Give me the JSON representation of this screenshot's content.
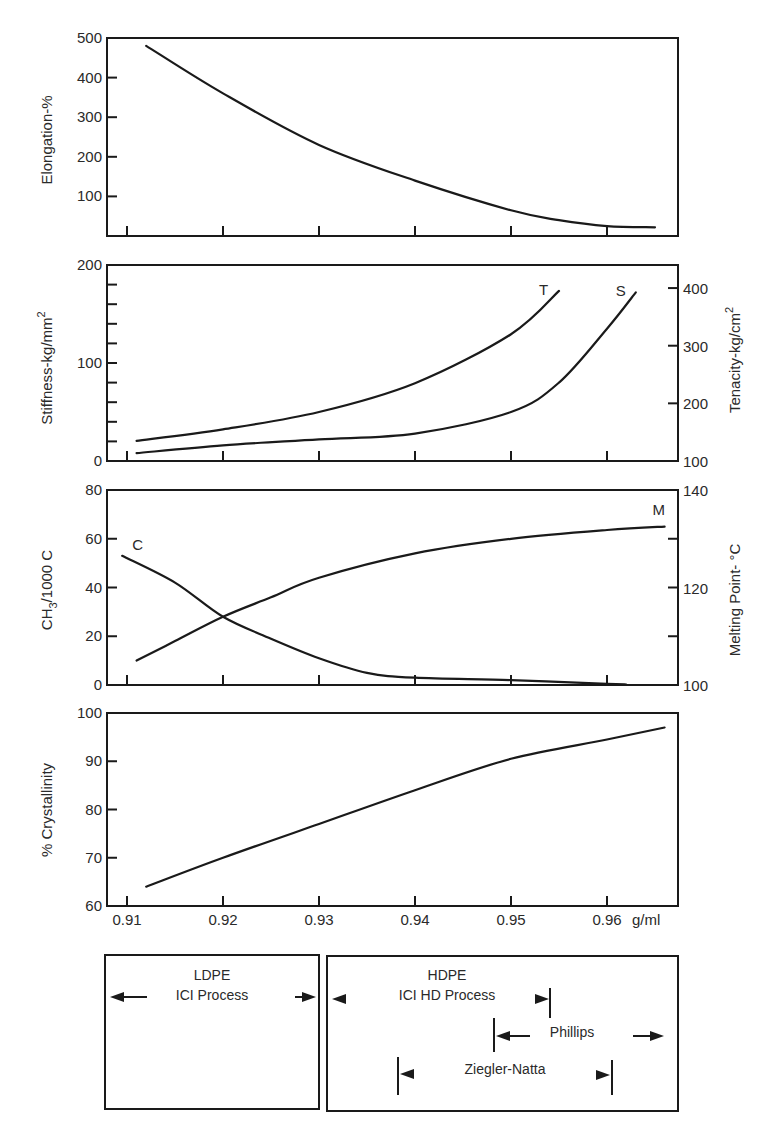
{
  "figure": {
    "x_axis": {
      "unit_label": "g/ml",
      "ticks": [
        "0.91",
        "0.92",
        "0.93",
        "0.94",
        "0.95",
        "0.96"
      ]
    },
    "process_boxes": {
      "ldpe": {
        "title": "LDPE",
        "process": "ICI Process"
      },
      "hdpe": {
        "title": "HDPE",
        "process": "ICI HD Process",
        "phillips": "Phillips",
        "ziegler": "Ziegler-Natta"
      }
    }
  },
  "chart_data": [
    {
      "type": "line",
      "title": "",
      "xlabel": "g/ml",
      "ylabel": "Elongation-%",
      "xlim": [
        0.909,
        0.968
      ],
      "ylim": [
        0,
        500
      ],
      "yticks": [
        "100",
        "200",
        "300",
        "400",
        "500"
      ],
      "series": [
        {
          "name": "Elongation",
          "label": "",
          "x": [
            0.912,
            0.92,
            0.93,
            0.94,
            0.95,
            0.955,
            0.96,
            0.965
          ],
          "values": [
            480,
            360,
            230,
            140,
            65,
            40,
            25,
            22
          ]
        }
      ]
    },
    {
      "type": "line",
      "title": "",
      "xlabel": "g/ml",
      "ylabel": "Stiffness-kg/mm2",
      "ylabel_right": "Tenacity-kg/cm2",
      "xlim": [
        0.909,
        0.968
      ],
      "ylim": [
        0,
        200
      ],
      "ylim_right": [
        100,
        440
      ],
      "yticks": [
        "0",
        "100",
        "200"
      ],
      "yticks_right": [
        "100",
        "200",
        "300",
        "400"
      ],
      "series": [
        {
          "name": "Tenacity",
          "label": "T",
          "axis": "right",
          "x": [
            0.911,
            0.92,
            0.93,
            0.94,
            0.95,
            0.955
          ],
          "values": [
            135,
            155,
            185,
            235,
            320,
            395
          ]
        },
        {
          "name": "Stiffness",
          "label": "S",
          "axis": "left",
          "x": [
            0.911,
            0.92,
            0.93,
            0.94,
            0.95,
            0.955,
            0.96,
            0.963
          ],
          "values": [
            8,
            16,
            22,
            28,
            50,
            80,
            135,
            172
          ]
        }
      ]
    },
    {
      "type": "line",
      "title": "",
      "xlabel": "g/ml",
      "ylabel": "CH3/1000 C",
      "ylabel_right": "Melting Point-°C",
      "xlim": [
        0.909,
        0.968
      ],
      "ylim": [
        0,
        80
      ],
      "ylim_right": [
        100,
        140
      ],
      "yticks": [
        "0",
        "20",
        "40",
        "60",
        "80"
      ],
      "yticks_right": [
        "100",
        "120",
        "140"
      ],
      "series": [
        {
          "name": "Branching",
          "label": "C",
          "axis": "left",
          "x": [
            0.9095,
            0.915,
            0.92,
            0.925,
            0.93,
            0.935,
            0.94,
            0.95,
            0.96,
            0.962
          ],
          "values": [
            53,
            42,
            28,
            19,
            11,
            5,
            3,
            2,
            0.5,
            0.2
          ]
        },
        {
          "name": "Melting Point",
          "label": "M",
          "axis": "right",
          "x": [
            0.911,
            0.915,
            0.92,
            0.925,
            0.93,
            0.94,
            0.95,
            0.96,
            0.966
          ],
          "values": [
            105,
            109,
            114,
            118,
            122,
            127,
            130,
            131.8,
            132.5
          ]
        }
      ]
    },
    {
      "type": "line",
      "title": "",
      "xlabel": "g/ml",
      "ylabel": "% Crystallinity",
      "xlim": [
        0.909,
        0.968
      ],
      "ylim": [
        60,
        100
      ],
      "yticks": [
        "60",
        "70",
        "80",
        "90",
        "100"
      ],
      "series": [
        {
          "name": "Crystallinity",
          "label": "",
          "x": [
            0.912,
            0.92,
            0.93,
            0.94,
            0.95,
            0.96,
            0.966
          ],
          "values": [
            64,
            70,
            77,
            84,
            90.5,
            94.5,
            97
          ]
        }
      ]
    }
  ]
}
